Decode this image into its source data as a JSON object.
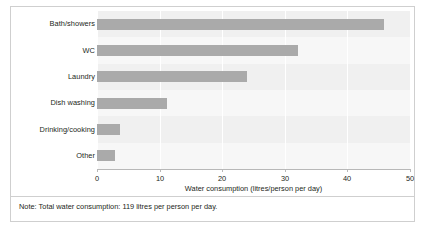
{
  "chart_data": {
    "type": "bar",
    "orientation": "horizontal",
    "title": "",
    "xlabel": "Water consumption (litres/person per day)",
    "ylabel": "",
    "categories": [
      "Bath/showers",
      "WC",
      "Laundry",
      "Dish washing",
      "Drinking/cooking",
      "Other"
    ],
    "values": [
      45.8,
      32.1,
      24.0,
      11.2,
      3.7,
      2.9
    ],
    "xlim": [
      0,
      50
    ],
    "xticks": [
      0,
      10,
      20,
      30,
      40,
      50
    ],
    "xtick_labels": [
      "0",
      "10",
      "20",
      "30",
      "40",
      "50"
    ],
    "grid": "vertical",
    "legend": "none",
    "bar_color": "#aaaaaa",
    "plot_background": "#f0f0f0",
    "gridline_color": "#ffffff",
    "note": "Note: Total water consumption: 119 litres per person per day."
  },
  "figure": {
    "note_text": "Note: Total water consumption: 119 litres per person per day.",
    "axis_title": "Water consumption (litres/person per day)"
  }
}
